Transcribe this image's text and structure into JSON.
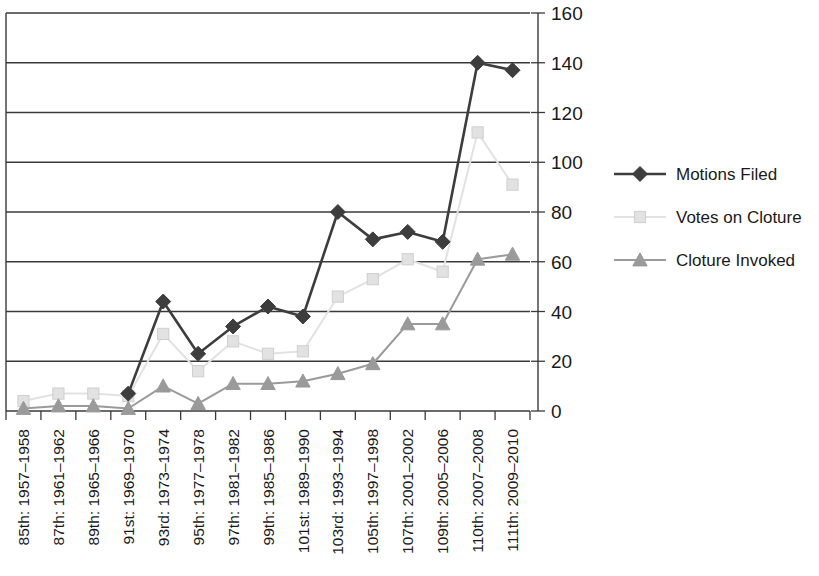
{
  "chart_data": {
    "type": "line",
    "title": "",
    "subtitle": "",
    "xlabel": "",
    "ylabel": "",
    "ylim": [
      0,
      160
    ],
    "yticks": [
      0,
      20,
      40,
      60,
      80,
      100,
      120,
      140,
      160
    ],
    "grid": true,
    "legend_position": "right",
    "categories": [
      "85th: 1957–1958",
      "87th: 1961–1962",
      "89th: 1965–1966",
      "91st: 1969–1970",
      "93rd: 1973–1974",
      "95th: 1977–1978",
      "97th: 1981–1982",
      "99th: 1985–1986",
      "101st: 1989–1990",
      "103rd: 1993–1994",
      "105th: 1997–1998",
      "107th: 2001–2002",
      "109th: 2005–2006",
      "110th: 2007–2008",
      "111th: 2009–2010"
    ],
    "series": [
      {
        "name": "Motions Filed",
        "color": "#3d3d3d",
        "marker": "diamond",
        "values": [
          null,
          null,
          null,
          7,
          44,
          23,
          34,
          42,
          38,
          80,
          69,
          72,
          68,
          140,
          137
        ]
      },
      {
        "name": "Votes on Cloture",
        "color": "#e2e2e2",
        "marker": "square",
        "values": [
          4,
          7,
          7,
          6,
          31,
          16,
          28,
          23,
          24,
          46,
          53,
          61,
          56,
          112,
          91
        ]
      },
      {
        "name": "Cloture Invoked",
        "color": "#9a9a9a",
        "marker": "triangle",
        "values": [
          1,
          2,
          2,
          1,
          10,
          3,
          11,
          11,
          12,
          15,
          19,
          35,
          35,
          61,
          63
        ]
      }
    ]
  },
  "legend": {
    "items": [
      {
        "label": "Motions Filed"
      },
      {
        "label": "Votes on Cloture"
      },
      {
        "label": "Cloture Invoked"
      }
    ]
  }
}
